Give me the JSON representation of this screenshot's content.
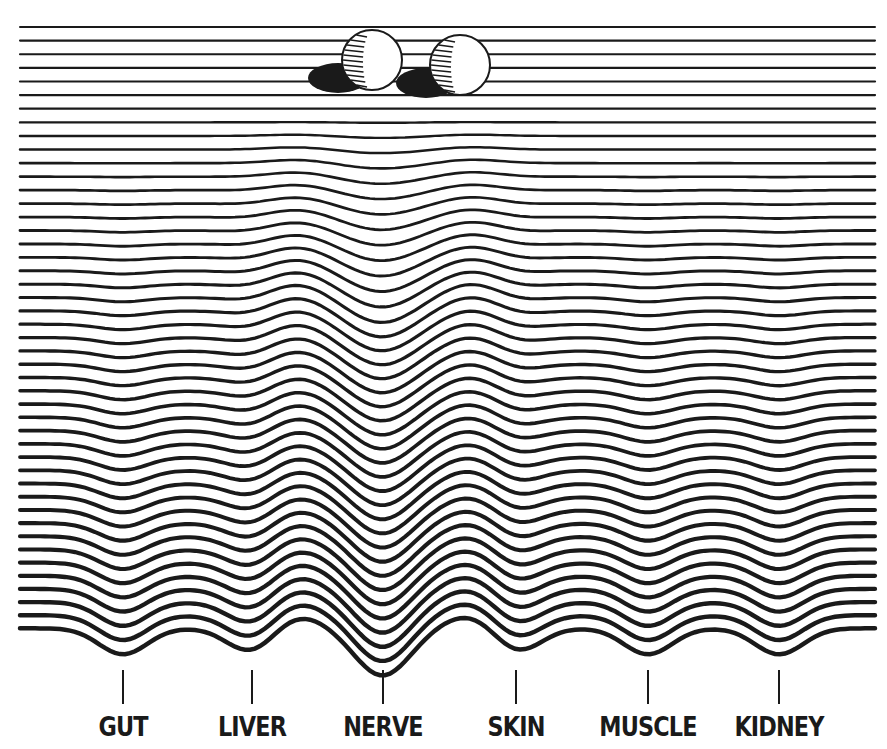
{
  "figure": {
    "colors": {
      "ink": "#1a1a1a",
      "background": "#ffffff"
    },
    "balls": [
      {
        "name": "cell-ball-1",
        "cx": 372,
        "cy": 60,
        "r": 30
      },
      {
        "name": "cell-ball-2",
        "cx": 460,
        "cy": 65,
        "r": 30
      }
    ],
    "valleys": [
      {
        "label": "GUT",
        "x": 123
      },
      {
        "label": "LIVER",
        "x": 252
      },
      {
        "label": "NERVE",
        "x": 383
      },
      {
        "label": "SKIN",
        "x": 516
      },
      {
        "label": "MUSCLE",
        "x": 648
      },
      {
        "label": "KIDNEY",
        "x": 779
      }
    ],
    "line_count": 46
  }
}
